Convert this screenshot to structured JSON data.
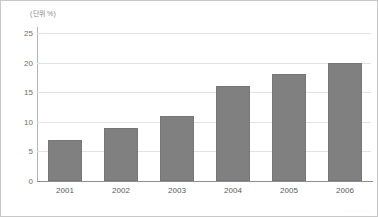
{
  "chart_data": {
    "type": "bar",
    "title": "",
    "subtitle": "",
    "unit_label": "(단위 %)",
    "xlabel": "",
    "ylabel": "",
    "categories": [
      "2001",
      "2002",
      "2003",
      "2004",
      "2005",
      "2006"
    ],
    "values": [
      7,
      9,
      11,
      16,
      18,
      20
    ],
    "series": [
      {
        "name": "",
        "values": [
          7,
          9,
          11,
          16,
          18,
          20
        ]
      }
    ],
    "ylim": [
      0,
      25
    ],
    "ytick_labels": [
      "0",
      "5",
      "10",
      "15",
      "20",
      "25"
    ],
    "ytick_values": [
      0,
      5,
      10,
      15,
      20,
      25
    ],
    "grid": true,
    "legend": false,
    "legend_position": "none",
    "bar_color": "#808080",
    "gridline_color": "#e2e2e2",
    "axis_color": "#8c8c8c",
    "text_color": "#5a5a5a",
    "background_color": "#ffffff"
  },
  "watermark": {
    "text": "···········"
  }
}
